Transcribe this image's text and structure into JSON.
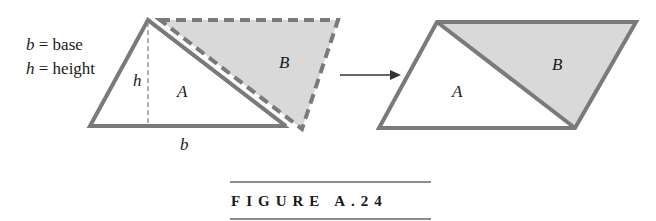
{
  "legend": {
    "line1": {
      "var": "b",
      "rest": " = base"
    },
    "line2": {
      "var": "h",
      "rest": " = height"
    }
  },
  "left_figure": {
    "height_label": "h",
    "base_label": "b",
    "region_a_label": "A",
    "region_b_label": "B"
  },
  "right_figure": {
    "region_a_label": "A",
    "region_b_label": "B"
  },
  "caption": "FIGURE A.24",
  "colors": {
    "outline": "#7a7a7a",
    "shade": "#d9d9d9",
    "text": "#1a1a1a"
  }
}
